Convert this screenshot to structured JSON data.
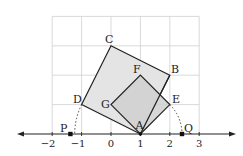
{
  "diagram": {
    "type": "coordinate-geometry",
    "grid": {
      "x_min": -2,
      "x_max": 3,
      "y_min": 0,
      "y_max": 4,
      "color": "#cccccc"
    },
    "number_line": {
      "ticks": [
        {
          "value": -2,
          "label": "−2"
        },
        {
          "value": -1,
          "label": "−1"
        },
        {
          "value": 0,
          "label": "0"
        },
        {
          "value": 1,
          "label": "1"
        },
        {
          "value": 2,
          "label": "2"
        },
        {
          "value": 3,
          "label": "3"
        }
      ]
    },
    "large_square": {
      "name": "ABCD",
      "vertices": {
        "A": [
          1,
          0
        ],
        "B": [
          2,
          2
        ],
        "C": [
          0,
          3
        ],
        "D": [
          -1,
          1
        ]
      },
      "fill": "#e4e4e4"
    },
    "small_square": {
      "name": "AEFG",
      "vertices": {
        "A": [
          1,
          0
        ],
        "E": [
          2,
          1
        ],
        "F": [
          1,
          2
        ],
        "G": [
          0,
          1
        ]
      },
      "fill": "#d2d2d2"
    },
    "points": {
      "P": {
        "label": "P",
        "value": -1.236
      },
      "Q": {
        "label": "Q",
        "value": 2.414
      }
    },
    "labels": {
      "A": "A",
      "B": "B",
      "C": "C",
      "D": "D",
      "E": "E",
      "F": "F",
      "G": "G",
      "P": "P",
      "Q": "Q"
    }
  }
}
